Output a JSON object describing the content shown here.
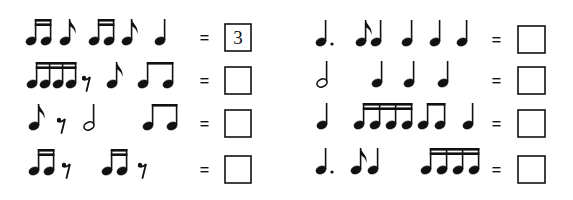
{
  "worksheet": {
    "ink_color": "#111111",
    "note_head": {
      "rx": 5.2,
      "ry": 3.9,
      "tilt_deg": -22
    },
    "stem_height": 22,
    "equals_sign": "=",
    "rows": [
      {
        "column": "left",
        "y": 41,
        "groups": [
          {
            "type": "sixteenth-pair",
            "x": [
              31,
              46
            ]
          },
          {
            "type": "eighth",
            "x": [
              65
            ]
          },
          {
            "type": "sixteenth-pair",
            "x": [
              94,
              109
            ]
          },
          {
            "type": "eighth",
            "x": [
              127
            ]
          },
          {
            "type": "quarter",
            "x": [
              160
            ]
          }
        ],
        "equals_x": 204,
        "box": {
          "x": 225,
          "y": 24,
          "w": 26,
          "h": 27
        },
        "answer": "3"
      },
      {
        "column": "left",
        "y": 84,
        "groups": [
          {
            "type": "sixteenth-quad",
            "x": [
              32,
              45,
              58,
              71
            ]
          },
          {
            "type": "eighth-rest",
            "x": [
              86
            ]
          },
          {
            "type": "eighth",
            "x": [
              112
            ]
          },
          {
            "type": "eighth-pair",
            "x": [
              143,
              168
            ]
          }
        ],
        "equals_x": 204,
        "box": {
          "x": 225,
          "y": 67,
          "w": 26,
          "h": 27
        },
        "answer": ""
      },
      {
        "column": "left",
        "y": 126,
        "groups": [
          {
            "type": "eighth",
            "x": [
              34
            ]
          },
          {
            "type": "eighth-rest",
            "x": [
              61
            ]
          },
          {
            "type": "half",
            "x": [
              89
            ]
          },
          {
            "type": "eighth-pair",
            "x": [
              148,
              172
            ]
          }
        ],
        "equals_x": 204,
        "box": {
          "x": 225,
          "y": 110,
          "w": 26,
          "h": 27
        },
        "answer": ""
      },
      {
        "column": "left",
        "y": 171,
        "groups": [
          {
            "type": "sixteenth-pair",
            "x": [
              34,
              49
            ]
          },
          {
            "type": "eighth-rest",
            "x": [
              66
            ]
          },
          {
            "type": "sixteenth-pair",
            "x": [
              107,
              122
            ]
          },
          {
            "type": "eighth-rest",
            "x": [
              142
            ]
          }
        ],
        "equals_x": 204,
        "box": {
          "x": 225,
          "y": 156,
          "w": 26,
          "h": 27
        },
        "answer": ""
      },
      {
        "column": "right",
        "y": 42,
        "groups": [
          {
            "type": "dotted-quarter",
            "x": [
              321
            ]
          },
          {
            "type": "eighth",
            "x": [
              361
            ]
          },
          {
            "type": "quarter",
            "x": [
              376
            ]
          },
          {
            "type": "quarter",
            "x": [
              407
            ]
          },
          {
            "type": "quarter",
            "x": [
              435
            ]
          },
          {
            "type": "quarter",
            "x": [
              462
            ]
          }
        ],
        "equals_x": 496,
        "box": {
          "x": 518,
          "y": 26,
          "w": 27,
          "h": 27
        },
        "answer": ""
      },
      {
        "column": "right",
        "y": 83,
        "groups": [
          {
            "type": "half",
            "x": [
              322
            ]
          },
          {
            "type": "quarter",
            "x": [
              377
            ]
          },
          {
            "type": "quarter",
            "x": [
              409
            ]
          },
          {
            "type": "quarter",
            "x": [
              443
            ]
          }
        ],
        "equals_x": 496,
        "box": {
          "x": 518,
          "y": 67,
          "w": 27,
          "h": 27
        },
        "answer": ""
      },
      {
        "column": "right",
        "y": 125,
        "groups": [
          {
            "type": "quarter",
            "x": [
              322
            ]
          },
          {
            "type": "sixteenth-quad",
            "x": [
              359,
              375,
              391,
              407
            ]
          },
          {
            "type": "eighth-pair",
            "x": [
              423,
              440
            ]
          },
          {
            "type": "quarter",
            "x": [
              468
            ]
          }
        ],
        "equals_x": 496,
        "box": {
          "x": 518,
          "y": 110,
          "w": 27,
          "h": 27
        },
        "answer": ""
      },
      {
        "column": "right",
        "y": 170,
        "groups": [
          {
            "type": "dotted-quarter",
            "x": [
              321
            ]
          },
          {
            "type": "eighth",
            "x": [
              356
            ]
          },
          {
            "type": "quarter",
            "x": [
              373
            ]
          },
          {
            "type": "sixteenth-quad",
            "x": [
              426,
              442,
              458,
              474
            ]
          }
        ],
        "equals_x": 496,
        "box": {
          "x": 518,
          "y": 156,
          "w": 27,
          "h": 27
        },
        "answer": ""
      }
    ]
  }
}
